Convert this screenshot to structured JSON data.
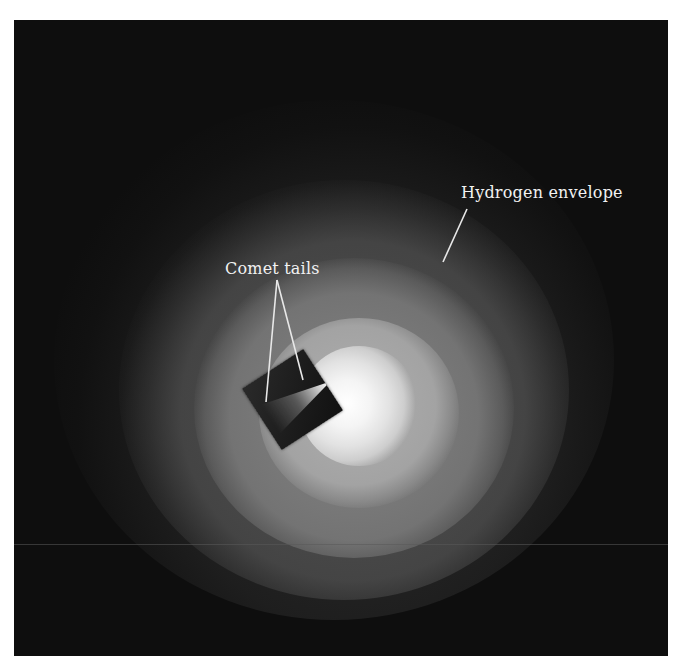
{
  "figure": {
    "colors": {
      "background": "#ffffff",
      "sky": "#0e0e0e",
      "core": "#ffffff",
      "label_text": "#f2f2f2",
      "pointer_line": "#e8e8e8"
    },
    "labels": {
      "hydrogen_envelope": "Hydrogen envelope",
      "comet_tails": "Comet tails"
    },
    "pointers": {
      "hydrogen_envelope": {
        "x1": 453,
        "y1": 189,
        "x2": 429,
        "y2": 242
      },
      "comet_tails_left": {
        "x1": 263,
        "y1": 260,
        "x2": 252,
        "y2": 382
      },
      "comet_tails_right": {
        "x1": 263,
        "y1": 260,
        "x2": 289,
        "y2": 360
      }
    }
  }
}
